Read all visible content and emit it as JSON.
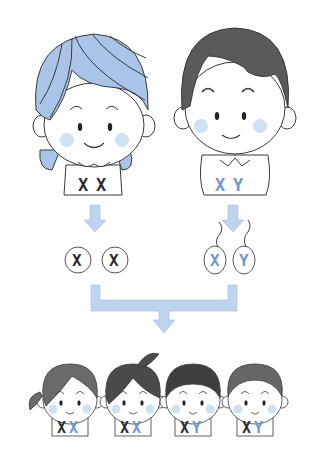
{
  "diagram": {
    "colors": {
      "x_from_mother": "#2b2b2b",
      "x_from_father": "#6f95d2",
      "y_from_father": "#6f95d2",
      "arrow_fill": "#bed3ee",
      "turban": "#a9c4e8",
      "hair": "#5a5a5a",
      "cheek": "#cfe2f3",
      "outline": "#3a3a3a"
    },
    "parents": [
      {
        "role": "mother",
        "label": "XX",
        "chars": [
          "X",
          "X"
        ]
      },
      {
        "role": "father",
        "label": "XY",
        "chars": [
          "X",
          "Y"
        ]
      }
    ],
    "gametes": {
      "mother": {
        "type": "egg",
        "chars": [
          "X",
          "X"
        ]
      },
      "father": {
        "type": "sperm",
        "chars": [
          "X",
          "Y"
        ]
      }
    },
    "children": [
      {
        "sex": "girl",
        "chars": [
          "X",
          "X"
        ]
      },
      {
        "sex": "girl",
        "chars": [
          "X",
          "X"
        ]
      },
      {
        "sex": "boy",
        "chars": [
          "X",
          "Y"
        ]
      },
      {
        "sex": "boy",
        "chars": [
          "X",
          "Y"
        ]
      }
    ]
  }
}
